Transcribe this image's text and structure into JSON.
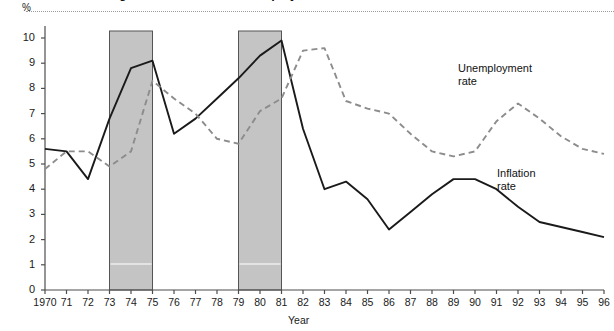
{
  "figure": {
    "title": "Figure 1  Inflation and unemployment rates, 1970–1996",
    "pct_symbol": "%",
    "x_axis_title": "Year",
    "series_labels": {
      "unemployment": [
        "Unemployment",
        "rate"
      ],
      "inflation": [
        "Inflation",
        "rate"
      ]
    },
    "colors": {
      "inflation_line": "#1a1a1a",
      "unemployment_line": "#8c8c8c",
      "recession_band": "#c4c4c4",
      "axis": "#4d4d4d",
      "background": "#ffffff"
    }
  },
  "chart_data": {
    "type": "line",
    "title": "Inflation and unemployment rates, 1970–1996",
    "xlabel": "Year",
    "ylabel": "%",
    "ylim": [
      0,
      10.6
    ],
    "xlim": [
      1970,
      1996
    ],
    "yticks": [
      0,
      1,
      2,
      3,
      4,
      5,
      6,
      7,
      8,
      9,
      10
    ],
    "ytick_labels": [
      "0",
      "1",
      "2",
      "3",
      "4",
      "5",
      "6",
      "7",
      "8",
      "9",
      "10"
    ],
    "grid": false,
    "legend": "inline-annotations",
    "x": [
      1970,
      1971,
      1972,
      1973,
      1974,
      1975,
      1976,
      1977,
      1978,
      1979,
      1980,
      1981,
      1982,
      1983,
      1984,
      1985,
      1986,
      1987,
      1988,
      1989,
      1990,
      1991,
      1992,
      1993,
      1994,
      1995,
      1996
    ],
    "xtick_labels": [
      "1970",
      "71",
      "72",
      "73",
      "74",
      "75",
      "76",
      "77",
      "78",
      "79",
      "80",
      "81",
      "82",
      "83",
      "84",
      "85",
      "86",
      "87",
      "88",
      "89",
      "90",
      "91",
      "92",
      "93",
      "94",
      "95",
      "96"
    ],
    "series": [
      {
        "name": "Inflation rate",
        "style": "solid",
        "color": "#1a1a1a",
        "values": [
          5.6,
          5.5,
          4.4,
          6.8,
          8.8,
          9.1,
          6.2,
          6.8,
          7.6,
          8.4,
          9.3,
          9.9,
          6.4,
          4.0,
          4.3,
          3.6,
          2.4,
          3.1,
          3.8,
          4.4,
          4.4,
          4.0,
          3.3,
          2.7,
          2.5,
          2.3,
          2.1
        ]
      },
      {
        "name": "Unemployment rate",
        "style": "dashed",
        "color": "#8c8c8c",
        "values": [
          4.8,
          5.5,
          5.5,
          4.9,
          5.5,
          8.3,
          7.6,
          7.0,
          6.0,
          5.8,
          7.1,
          7.6,
          9.5,
          9.6,
          7.5,
          7.2,
          7.0,
          6.2,
          5.5,
          5.3,
          5.5,
          6.7,
          7.4,
          6.8,
          6.1,
          5.6,
          5.4
        ]
      }
    ],
    "annotations": [
      {
        "label": "Recession",
        "type": "shaded-band",
        "x_start": 1973,
        "x_end": 1975
      },
      {
        "label": "Recession",
        "type": "shaded-band",
        "x_start": 1979,
        "x_end": 1981
      }
    ]
  }
}
